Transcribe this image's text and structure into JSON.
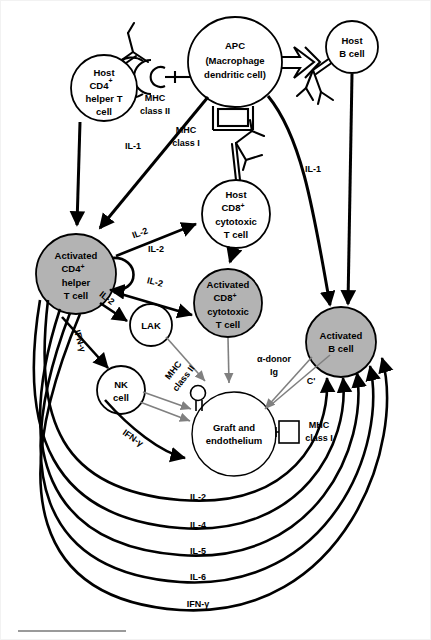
{
  "figure": {
    "background_color": "#ffffff",
    "line_color": "#000000",
    "shaded_fill": "#b3b3b3",
    "unshaded_fill": "#ffffff",
    "gray_arrow_color": "#808080",
    "rule_color": "#9a9a9a"
  },
  "cells": {
    "host_cd4": {
      "name": "host-cd4-helper-t-cell",
      "lines": [
        "Host",
        "CD4",
        "helper T",
        "cell"
      ],
      "superscript": "+",
      "shaded": false,
      "cx": 104,
      "cy": 88,
      "r": 33
    },
    "apc": {
      "name": "apc-cell",
      "lines": [
        "APC",
        "(Macrophage",
        "dendritic cell)"
      ],
      "shaded": false,
      "cx": 235,
      "cy": 62,
      "rx": 47,
      "ry": 45
    },
    "host_b": {
      "name": "host-b-cell",
      "lines": [
        "Host",
        "B cell"
      ],
      "shaded": false,
      "cx": 352,
      "cy": 47,
      "r": 26
    },
    "host_cd8": {
      "name": "host-cd8-cytotoxic-t-cell",
      "lines": [
        "Host",
        "CD8",
        "cytotoxic",
        "T cell"
      ],
      "superscript": "+",
      "shaded": false,
      "cx": 236,
      "cy": 214,
      "r": 34
    },
    "activated_cd4": {
      "name": "activated-cd4-helper-t-cell",
      "lines": [
        "Activated",
        "CD4",
        "helper",
        "T cell"
      ],
      "superscript": "+",
      "shaded": true,
      "cx": 76,
      "cy": 274,
      "r": 40
    },
    "activated_cd8": {
      "name": "activated-cd8-cytotoxic-t-cell",
      "lines": [
        "Activated",
        "CD8",
        "cytotoxic",
        "T cell"
      ],
      "superscript": "+",
      "shaded": true,
      "cx": 228,
      "cy": 303,
      "r": 34
    },
    "activated_b": {
      "name": "activated-b-cell",
      "lines": [
        "Activated",
        "B cell"
      ],
      "shaded": true,
      "cx": 341,
      "cy": 342,
      "r": 35
    },
    "lak": {
      "name": "lak-cell",
      "lines": [
        "LAK"
      ],
      "shaded": false,
      "cx": 151,
      "cy": 325,
      "r": 21
    },
    "nk": {
      "name": "nk-cell",
      "lines": [
        "NK",
        "cell"
      ],
      "shaded": false,
      "cx": 121,
      "cy": 390,
      "r": 24
    },
    "graft": {
      "name": "graft-and-endothelium",
      "lines": [
        "Graft and",
        "endothelium"
      ],
      "shaded": false,
      "cx": 234,
      "cy": 434,
      "r": 42
    }
  },
  "receptor_labels": {
    "mhc_class_ii_apc": {
      "lines": [
        "MHC",
        "class II"
      ],
      "x": 155,
      "y": 98
    },
    "mhc_class_i_apc": {
      "lines": [
        "MHC",
        "class I"
      ],
      "x": 186,
      "y": 130
    },
    "mhc_class_ii_lak": {
      "lines": [
        "MHC",
        "class II"
      ],
      "x": 178,
      "y": 374,
      "rotated": true
    },
    "mhc_class_i_graft": {
      "lines": [
        "MHC",
        "class I"
      ],
      "x": 319,
      "y": 428
    }
  },
  "cytokine_labels": {
    "il1_left": "IL-1",
    "il1_right": "IL-1",
    "il2_to_cd8": "IL-2",
    "il2_autocrine": "IL-2",
    "il2_to_activated_cd8": "IL-2",
    "il2_to_lak": "IL-2",
    "ifn_gamma_cd4": "IFN-γ",
    "ifn_gamma_nk": "IFN-γ",
    "alpha_donor_ig": [
      "α-donor",
      "Ig"
    ],
    "complement": "C'"
  },
  "bottom_arcs": [
    {
      "label": "IL-2",
      "y": 497
    },
    {
      "label": "IL-4",
      "y": 525
    },
    {
      "label": "IL-5",
      "y": 551
    },
    {
      "label": "IL-6",
      "y": 577
    },
    {
      "label": "IFN-γ",
      "y": 604
    }
  ],
  "footer_rule": {
    "name": "footer-rule",
    "x": 18,
    "y": 631,
    "width": 108
  }
}
